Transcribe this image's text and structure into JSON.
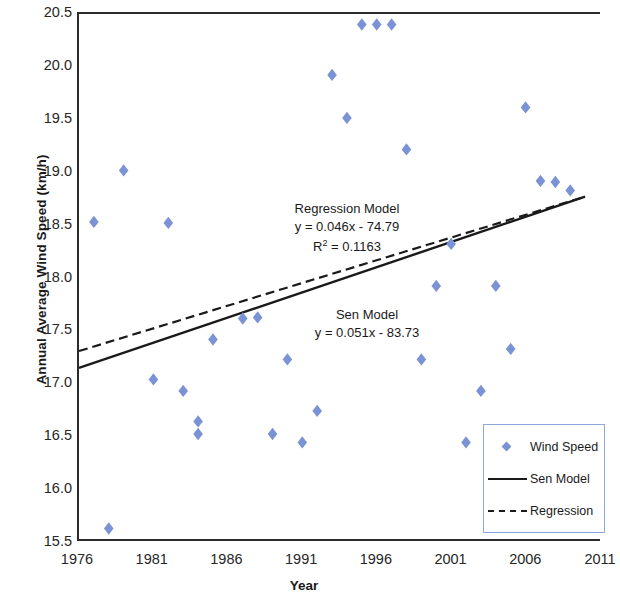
{
  "chart_data": {
    "type": "scatter",
    "title": "",
    "xlabel": "Year",
    "ylabel": "Annual Average Wind Speed (km/h)",
    "xlim": [
      1976,
      2011
    ],
    "ylim": [
      15.5,
      20.5
    ],
    "xticks": [
      1976,
      1981,
      1986,
      1991,
      1996,
      2001,
      2006,
      2011
    ],
    "yticks": [
      "15.5",
      "16.0",
      "16.5",
      "17.0",
      "17.5",
      "18.0",
      "18.5",
      "19.0",
      "19.5",
      "20.0",
      "20.5"
    ],
    "grid": false,
    "legend_position": "bottom-right",
    "marker_color": "#7b93d4",
    "line_color": "#1a1a1a",
    "axis_color": "#2b2b2b",
    "legend_border_color": "#8ea9dd",
    "series": [
      {
        "name": "Wind Speed",
        "type": "scatter",
        "marker": "diamond",
        "x": [
          1977,
          1978,
          1979,
          1981,
          1982,
          1983,
          1984,
          1984,
          1985,
          1987,
          1988,
          1989,
          1990,
          1991,
          1992,
          1993,
          1994,
          1995,
          1996,
          1997,
          1998,
          1999,
          2000,
          2001,
          2002,
          2003,
          2004,
          2005,
          2006,
          2007,
          2008,
          2009
        ],
        "y": [
          18.52,
          15.6,
          19.01,
          17.02,
          18.51,
          16.91,
          16.5,
          16.62,
          17.4,
          17.6,
          17.61,
          16.5,
          17.21,
          16.42,
          16.72,
          19.92,
          19.51,
          20.4,
          20.4,
          20.4,
          19.21,
          17.21,
          17.91,
          18.31,
          16.42,
          16.91,
          17.91,
          17.31,
          19.61,
          18.91,
          18.9,
          18.82
        ]
      },
      {
        "name": "Sen Model",
        "type": "line",
        "style": "solid",
        "equation": "y = 0.051x - 83.73",
        "slope": 0.051,
        "intercept": -83.73,
        "endpoints": [
          [
            1976,
            17.13
          ],
          [
            2010,
            18.76
          ]
        ]
      },
      {
        "name": "Regression",
        "type": "line",
        "style": "dashed",
        "equation": "y = 0.046x - 74.79",
        "slope": 0.046,
        "intercept": -74.79,
        "r_squared": 0.1163,
        "endpoints": [
          [
            1976,
            17.29
          ],
          [
            2010,
            18.76
          ]
        ]
      }
    ],
    "annotations": [
      {
        "id": "regression",
        "lines": [
          "Regression Model",
          "y = 0.046x - 74.79",
          "R² = 0.1163"
        ],
        "line1": "Regression Model",
        "line2": "y = 0.046x - 74.79",
        "line3_prefix": "R",
        "line3_sup": "2",
        "line3_rest": " = 0.1163"
      },
      {
        "id": "sen",
        "lines": [
          "Sen Model",
          "y = 0.051x - 83.73"
        ],
        "line1": "Sen Model",
        "line2": "y = 0.051x - 83.73"
      }
    ],
    "legend_entries": [
      {
        "label": "Wind Speed",
        "key": "diamond-marker"
      },
      {
        "label": "Sen Model",
        "key": "solid-line"
      },
      {
        "label": "Regression",
        "key": "dashed-line"
      }
    ]
  }
}
